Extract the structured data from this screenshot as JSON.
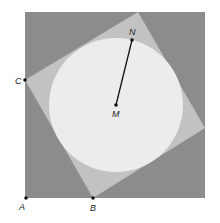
{
  "diagram": {
    "outer_square": {
      "x": 25,
      "y": 12,
      "width": 180,
      "height": 186,
      "fill": "#8c8c8c"
    },
    "inner_square": {
      "points": "25,80 138,12 205,128 93,198",
      "fill": "#c2c2c2"
    },
    "circle": {
      "cx": 116,
      "cy": 105,
      "r": 67,
      "fill": "#ececec"
    },
    "segment": {
      "from": "M",
      "to": "N",
      "color": "#111111"
    },
    "points": [
      {
        "id": "A",
        "label": "A",
        "x": 26,
        "y": 198,
        "lx": 19,
        "ly": 210
      },
      {
        "id": "B",
        "label": "B",
        "x": 93,
        "y": 198,
        "lx": 90,
        "ly": 211
      },
      {
        "id": "C",
        "label": "C",
        "x": 25,
        "y": 80,
        "lx": 15,
        "ly": 84
      },
      {
        "id": "M",
        "label": "M",
        "x": 116,
        "y": 105,
        "lx": 112,
        "ly": 117
      },
      {
        "id": "N",
        "label": "N",
        "x": 132,
        "y": 40,
        "lx": 129,
        "ly": 35
      }
    ]
  }
}
